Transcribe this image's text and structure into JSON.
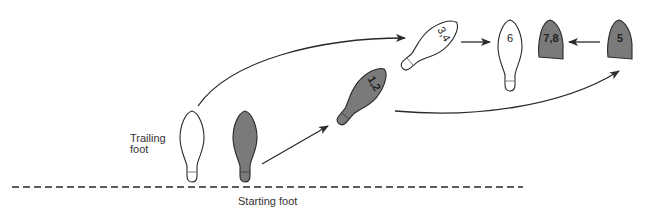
{
  "diagram": {
    "labels": {
      "trailing_foot_line1": "Trailing",
      "trailing_foot_line2": "foot",
      "starting_foot": "Starting foot"
    },
    "steps": [
      {
        "id": "trailing-foot",
        "label": "",
        "shape": "full-sole",
        "fill": "white"
      },
      {
        "id": "starting-foot",
        "label": "",
        "shape": "full-sole",
        "fill": "gray"
      },
      {
        "id": "step-1-2",
        "label": "1,2",
        "shape": "full-sole-angled",
        "fill": "gray"
      },
      {
        "id": "step-3-4",
        "label": "3,4",
        "shape": "full-sole-angled",
        "fill": "white"
      },
      {
        "id": "step-6",
        "label": "6",
        "shape": "full-sole",
        "fill": "white"
      },
      {
        "id": "step-7-8",
        "label": "7,8",
        "shape": "ball-only",
        "fill": "gray"
      },
      {
        "id": "step-5",
        "label": "5",
        "shape": "ball-only",
        "fill": "gray"
      }
    ],
    "arrows": [
      {
        "from": "trailing-foot",
        "to": "step-3-4",
        "type": "curved"
      },
      {
        "from": "starting-foot",
        "to": "step-1-2",
        "type": "straight"
      },
      {
        "from": "step-1-2",
        "to": "step-5",
        "type": "curved"
      },
      {
        "from": "step-3-4",
        "to": "step-6",
        "type": "straight"
      },
      {
        "from": "step-5",
        "to": "step-7-8",
        "type": "straight"
      }
    ],
    "colors": {
      "gray_fill": "#7a7a7a",
      "white_fill": "#ffffff",
      "stroke": "#2a2a2a",
      "text": "#222222"
    }
  }
}
